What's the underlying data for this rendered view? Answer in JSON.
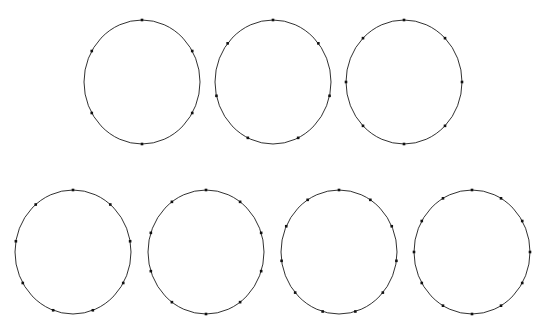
{
  "figure": {
    "name": "circles-with-boundary-points",
    "background_color": "#ffffff",
    "width": 555,
    "height": 333,
    "stroke_color": "#1a1a1a",
    "stroke_width": 0.9,
    "point_color": "#111111",
    "point_size": 2.6,
    "point_shape": "square"
  },
  "chart_data": {
    "type": "scatter",
    "title": "",
    "subtitle": "",
    "xlabel": "",
    "ylabel": "",
    "grid": false,
    "legend": null,
    "axes_visible": false,
    "tick_labels": [],
    "annotations": [],
    "point_counts": [
      6,
      7,
      8,
      9,
      10,
      11,
      12
    ],
    "rows": [
      {
        "row_index": 0,
        "count_in_row": 3,
        "center_y": 82
      },
      {
        "row_index": 1,
        "count_in_row": 4,
        "center_y": 252
      }
    ],
    "series": [
      {
        "name": "circle-1",
        "row": 0,
        "column": 0,
        "n_points": 6,
        "center_x": 142,
        "center_y": 82,
        "radius_x": 58,
        "radius_y": 62,
        "start_angle_deg": 90,
        "step_angle_deg": 60,
        "angles_deg": [
          90,
          150,
          210,
          270,
          330,
          30
        ]
      },
      {
        "name": "circle-2",
        "row": 0,
        "column": 1,
        "n_points": 7,
        "center_x": 273,
        "center_y": 82,
        "radius_x": 58,
        "radius_y": 62,
        "start_angle_deg": 90,
        "step_angle_deg": 51.4286,
        "angles_deg": [
          90,
          141.43,
          192.86,
          244.29,
          295.71,
          347.14,
          38.57
        ]
      },
      {
        "name": "circle-3",
        "row": 0,
        "column": 2,
        "n_points": 8,
        "center_x": 404,
        "center_y": 82,
        "radius_x": 58,
        "radius_y": 62,
        "start_angle_deg": 90,
        "step_angle_deg": 45,
        "angles_deg": [
          90,
          135,
          180,
          225,
          270,
          315,
          0,
          45
        ]
      },
      {
        "name": "circle-4",
        "row": 1,
        "column": 0,
        "n_points": 9,
        "center_x": 73,
        "center_y": 252,
        "radius_x": 58,
        "radius_y": 62,
        "start_angle_deg": 90,
        "step_angle_deg": 40,
        "angles_deg": [
          90,
          130,
          170,
          210,
          250,
          290,
          330,
          10,
          50
        ]
      },
      {
        "name": "circle-5",
        "row": 1,
        "column": 1,
        "n_points": 10,
        "center_x": 206,
        "center_y": 252,
        "radius_x": 58,
        "radius_y": 62,
        "start_angle_deg": 90,
        "step_angle_deg": 36,
        "angles_deg": [
          90,
          126,
          162,
          198,
          234,
          270,
          306,
          342,
          18,
          54
        ]
      },
      {
        "name": "circle-6",
        "row": 1,
        "column": 2,
        "n_points": 11,
        "center_x": 339,
        "center_y": 252,
        "radius_x": 58,
        "radius_y": 62,
        "start_angle_deg": 90,
        "step_angle_deg": 32.7273,
        "angles_deg": [
          90,
          122.73,
          155.45,
          188.18,
          220.91,
          253.64,
          286.36,
          319.09,
          351.82,
          24.55,
          57.27
        ]
      },
      {
        "name": "circle-7",
        "row": 1,
        "column": 3,
        "n_points": 12,
        "center_x": 472,
        "center_y": 252,
        "radius_x": 58,
        "radius_y": 62,
        "start_angle_deg": 90,
        "step_angle_deg": 30,
        "angles_deg": [
          90,
          120,
          150,
          180,
          210,
          240,
          270,
          300,
          330,
          0,
          30,
          60
        ]
      }
    ]
  }
}
